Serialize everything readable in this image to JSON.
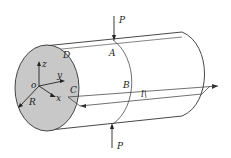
{
  "diagram": {
    "type": "cylinder-loading",
    "labels": {
      "force_top": "P",
      "force_bottom": "P",
      "point_a": "A",
      "point_b": "B",
      "point_c": "C",
      "point_d": "D",
      "origin": "o",
      "axis_x": "x",
      "axis_y": "y",
      "axis_z": "z",
      "radius": "R",
      "length": "l"
    },
    "colors": {
      "end_face": "#c8c8c8",
      "stroke": "#333333",
      "background": "#ffffff"
    }
  }
}
